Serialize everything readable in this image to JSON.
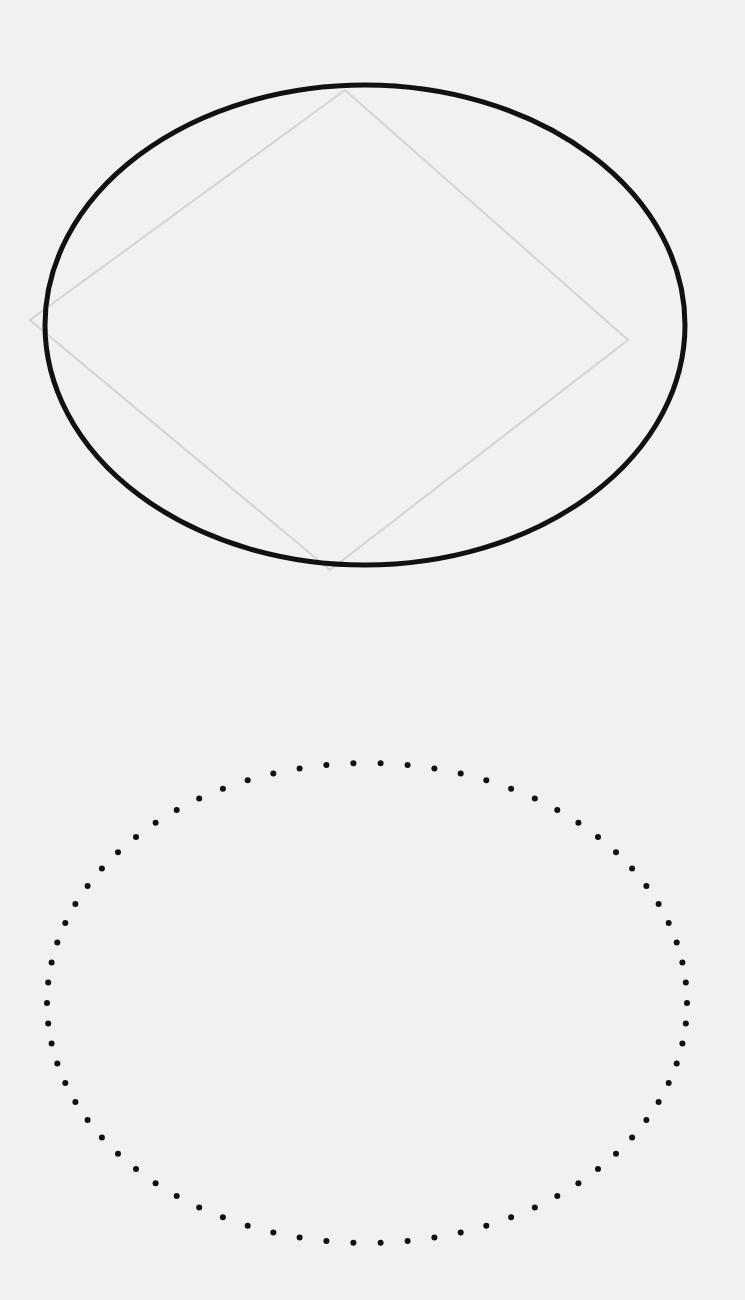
{
  "page": {
    "background": "#f1f1f1",
    "ink": "#111111",
    "faint_ink": "#d4d4d4"
  },
  "figures": [
    {
      "id": "solid-ellipse",
      "style": "solid",
      "cx": 365,
      "cy": 325,
      "rx": 320,
      "ry": 240,
      "stroke_width": 5
    },
    {
      "id": "faint-diamond",
      "style": "faint-pencil",
      "points": [
        [
          345,
          90
        ],
        [
          628,
          340
        ],
        [
          330,
          570
        ],
        [
          30,
          320
        ]
      ]
    },
    {
      "id": "dotted-ellipse",
      "style": "dotted",
      "cx": 367,
      "cy": 1003,
      "rx": 320,
      "ry": 240,
      "dot_count": 74,
      "dot_radius": 3
    }
  ]
}
